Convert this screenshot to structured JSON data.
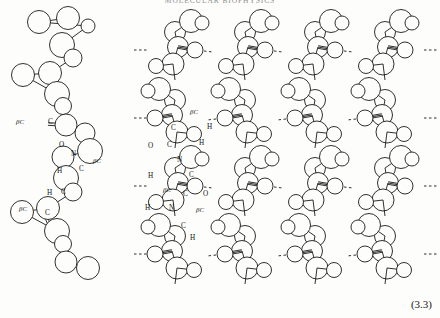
{
  "page": {
    "width": 440,
    "height": 318,
    "background": "#fdfdfb",
    "running_head": "MOLECULAR BIOPHYSICS",
    "equation_number": "(3.3)"
  },
  "figure": {
    "ink_color": "#1a1a1a",
    "stroke_width": 0.9,
    "atom_types": {
      "C": "carbon",
      "O": "oxygen",
      "N": "nitrogen",
      "H": "hydrogen",
      "betaC": "beta-carbon"
    },
    "left_chain": {
      "name": "single-polypeptide-chain",
      "labels": [
        {
          "text": "βC",
          "x": 16,
          "y": 124,
          "italic": true
        },
        {
          "text": "C",
          "x": 48,
          "y": 124,
          "italic": false
        },
        {
          "text": "O",
          "x": 59,
          "y": 147,
          "italic": false
        },
        {
          "text": "N",
          "x": 71,
          "y": 156,
          "italic": false
        },
        {
          "text": "βC",
          "x": 93,
          "y": 163,
          "italic": true
        },
        {
          "text": "H",
          "x": 57,
          "y": 173,
          "italic": false
        },
        {
          "text": "C",
          "x": 79,
          "y": 171,
          "italic": false
        },
        {
          "text": "H",
          "x": 47,
          "y": 195,
          "italic": false
        },
        {
          "text": "C",
          "x": 61,
          "y": 194,
          "italic": false
        },
        {
          "text": "βC",
          "x": 19,
          "y": 211,
          "italic": true
        },
        {
          "text": "C",
          "x": 45,
          "y": 215,
          "italic": false
        }
      ],
      "backbone": [
        {
          "x": 68,
          "y": 18,
          "r": 11.5
        },
        {
          "x": 39,
          "y": 22,
          "r": 11.5
        },
        {
          "x": 88,
          "y": 26,
          "r": 7.0
        },
        {
          "x": 62,
          "y": 45,
          "r": 12.5
        },
        {
          "x": 73,
          "y": 58,
          "r": 9.0
        },
        {
          "x": 50,
          "y": 73,
          "r": 11.5
        },
        {
          "x": 23,
          "y": 75,
          "r": 11.5
        },
        {
          "x": 57,
          "y": 94,
          "r": 12.5
        },
        {
          "x": 63,
          "y": 106,
          "r": 8.5
        },
        {
          "x": 66,
          "y": 125,
          "r": 11.0
        },
        {
          "x": 85,
          "y": 133,
          "r": 10.0
        },
        {
          "x": 90,
          "y": 151,
          "r": 12.5
        },
        {
          "x": 63,
          "y": 157,
          "r": 11.0
        },
        {
          "x": 66,
          "y": 178,
          "r": 12.5
        },
        {
          "x": 73,
          "y": 192,
          "r": 9.0
        },
        {
          "x": 48,
          "y": 208,
          "r": 11.5
        },
        {
          "x": 22,
          "y": 212,
          "r": 11.5
        },
        {
          "x": 57,
          "y": 231,
          "r": 12.5
        },
        {
          "x": 63,
          "y": 244,
          "r": 8.5
        },
        {
          "x": 66,
          "y": 262,
          "r": 11.0
        },
        {
          "x": 88,
          "y": 268,
          "r": 11.5
        }
      ]
    },
    "sheet": {
      "name": "beta-pleated-sheet-array",
      "strand_count": 4,
      "labels": [
        {
          "text": "βC",
          "x": 190,
          "y": 114,
          "italic": true
        },
        {
          "text": "C",
          "x": 171,
          "y": 130,
          "italic": false
        },
        {
          "text": "H",
          "x": 207,
          "y": 129,
          "italic": false
        },
        {
          "text": "O",
          "x": 148,
          "y": 148,
          "italic": false
        },
        {
          "text": "C",
          "x": 167,
          "y": 147,
          "italic": false
        },
        {
          "text": "H",
          "x": 199,
          "y": 145,
          "italic": false
        },
        {
          "text": "N",
          "x": 177,
          "y": 162,
          "italic": false
        },
        {
          "text": "H",
          "x": 148,
          "y": 178,
          "italic": false
        },
        {
          "text": "C",
          "x": 189,
          "y": 177,
          "italic": false
        },
        {
          "text": "βC",
          "x": 163,
          "y": 192,
          "italic": true
        },
        {
          "text": "C",
          "x": 183,
          "y": 196,
          "italic": false
        },
        {
          "text": "O",
          "x": 203,
          "y": 196,
          "italic": false
        },
        {
          "text": "H",
          "x": 145,
          "y": 210,
          "italic": false
        },
        {
          "text": "N",
          "x": 169,
          "y": 210,
          "italic": false
        },
        {
          "text": "βC",
          "x": 196,
          "y": 212,
          "italic": true
        },
        {
          "text": "C",
          "x": 181,
          "y": 228,
          "italic": false
        },
        {
          "text": "H",
          "x": 190,
          "y": 240,
          "italic": false
        }
      ]
    }
  }
}
